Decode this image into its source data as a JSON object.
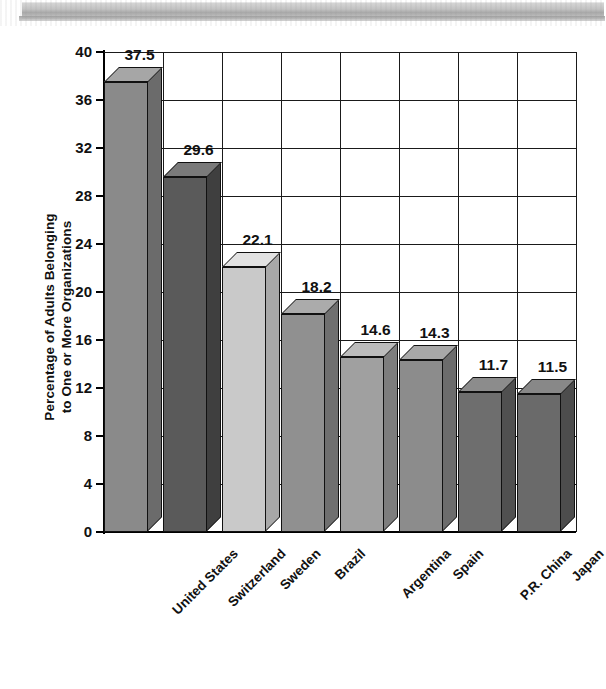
{
  "figure": {
    "kind": "scanned-bar-chart",
    "background_color": "#ffffff",
    "scan_artifact": {
      "present": true,
      "name": "scan-edge-band",
      "color": "#c2c2c2"
    }
  },
  "chart_data": {
    "type": "bar",
    "title": "",
    "xlabel": "",
    "ylabel": "Percentage of Adults Belonging to One or More Organizations",
    "ylabel_lines": [
      "Percentage of Adults Belonging",
      "to One or More Organizations"
    ],
    "categories": [
      "United States",
      "Switzerland",
      "Sweden",
      "Brazil",
      "Argentina",
      "Spain",
      "P.R. China",
      "Japan"
    ],
    "values": [
      37.5,
      29.6,
      22.1,
      18.2,
      14.6,
      14.3,
      11.7,
      11.5
    ],
    "value_labels": [
      "37.5",
      "29.6",
      "22.1",
      "18.2",
      "14.6",
      "14.3",
      "11.7",
      "11.5"
    ],
    "ylim": [
      0,
      40
    ],
    "ytick_labels": [
      "0",
      "4",
      "8",
      "12",
      "16",
      "20",
      "24",
      "28",
      "32",
      "36",
      "40"
    ],
    "ytick_values": [
      0,
      4,
      8,
      12,
      16,
      20,
      24,
      28,
      32,
      36,
      40
    ],
    "grid": "horizontal-and-vertical",
    "legend": "none",
    "three_d": true,
    "bar_colors": [
      "#8a8a8a",
      "#5a5a5a",
      "#c9c9c9",
      "#909090",
      "#a0a0a0",
      "#8c8c8c",
      "#6e6e6e",
      "#6a6a6a"
    ],
    "bar_top_colors": [
      "#a6a6a6",
      "#7a7a7a",
      "#e2e2e2",
      "#ababab",
      "#bcbcbc",
      "#a8a8a8",
      "#8c8c8c",
      "#888888"
    ],
    "bar_side_colors": [
      "#6b6b6b",
      "#3f3f3f",
      "#a8a8a8",
      "#6f6f6f",
      "#7d7d7d",
      "#6c6c6c",
      "#505050",
      "#4d4d4d"
    ]
  }
}
